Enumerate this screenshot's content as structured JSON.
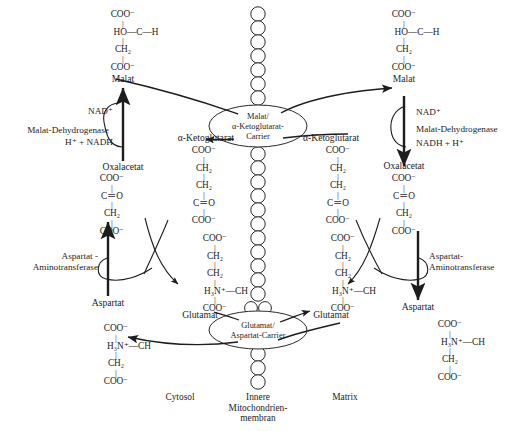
{
  "diagram": {
    "language": "de"
  },
  "compartments": [
    {
      "id": "cytosol",
      "label": "Cytosol"
    },
    {
      "id": "membrane",
      "label": "Innere\nMitochondrien-\nmembran",
      "line1": "Innere",
      "line2": "Mitochondrien-",
      "line3": "membran"
    },
    {
      "id": "matrix",
      "label": "Matrix"
    }
  ],
  "carriers": [
    {
      "id": "malat-ketoglutarat-carrier",
      "line1": "Malat/",
      "line2": "α-Ketoglutarat-",
      "line3": "Carrier"
    },
    {
      "id": "glutamat-aspartat-carrier",
      "line1": "Glutamat/",
      "line2": "Aspartat-Carrier",
      "line3": ""
    }
  ],
  "enzymes": {
    "mdh_left": {
      "line1": "Malat-Dehydrogenase"
    },
    "mdh_right": {
      "line1": "Malat-Dehydrogenase"
    },
    "ast_left": {
      "line1": "Aspartat -",
      "line2": "Aminotransferase"
    },
    "ast_right": {
      "line1": "Aspartat-",
      "line2": "Aminotransferase"
    }
  },
  "cofactors": {
    "nad_left": "NAD⁺",
    "nadh_left": "H⁺ + NADH",
    "nad_right": "NAD⁺",
    "nadh_right": "NADH + H⁺"
  },
  "metabolites": {
    "malat_left": "Malat",
    "malat_right": "Malat",
    "oxalacetat_left": "Oxalacetat",
    "oxalacetat_right": "Oxalacetat",
    "aspartat_left": "Aspartat",
    "aspartat_right": "Aspartat",
    "glutamat_left": "Glutamat",
    "glutamat_right": "Glutamat",
    "ketoglutarat_left": "α-Ketoglutarat",
    "ketoglutarat_right": "α-Ketoglutarat"
  },
  "structures": {
    "malat": {
      "name": "Malat",
      "rows": [
        "COO⁻",
        "HO—C—H",
        "CH₂",
        "COO⁻"
      ]
    },
    "oxalacetat": {
      "name": "Oxalacetat",
      "rows": [
        "COO⁻",
        "C＝O",
        "CH₂",
        "COO⁻"
      ]
    },
    "ketoglutarat": {
      "name": "α-Ketoglutarat",
      "rows": [
        "COO⁻",
        "CH₂",
        "CH₂",
        "C＝O",
        "COO⁻"
      ]
    },
    "glutamat": {
      "name": "Glutamat",
      "rows": [
        "COO⁻",
        "CH₂",
        "CH₂",
        "H₃N⁺—CH",
        "COO⁻"
      ]
    },
    "aspartat": {
      "name": "Aspartat",
      "rows": [
        "COO⁻",
        "H₃N⁺—CH",
        "CH₂",
        "COO⁻"
      ]
    }
  },
  "colors": {
    "ink": "#1d1d1d",
    "line": "#2a2a2a",
    "background": "#ffffff"
  }
}
